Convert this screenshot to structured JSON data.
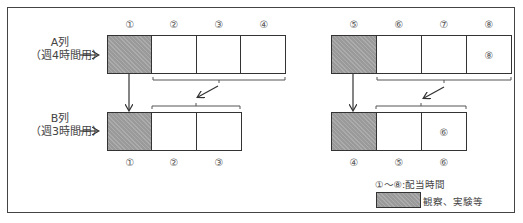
{
  "labels": {
    "a_row_line1": "A列",
    "a_row_line2": "（週4時間用）",
    "b_row_line1": "B列",
    "b_row_line2": "（週3時間用）",
    "arrow": "→"
  },
  "a_left": {
    "top_numbers": [
      "①",
      "②",
      "③",
      "④"
    ],
    "inner": [
      "",
      "",
      "",
      ""
    ]
  },
  "a_right": {
    "top_numbers": [
      "⑤",
      "⑥",
      "⑦",
      "⑧"
    ],
    "inner": [
      "",
      "",
      "",
      "⑧"
    ]
  },
  "b_left": {
    "bottom_numbers": [
      "①",
      "②",
      "③"
    ],
    "inner": [
      "",
      "",
      ""
    ]
  },
  "b_right": {
    "bottom_numbers": [
      "④",
      "⑤",
      "⑥"
    ],
    "inner": [
      "",
      "",
      "⑥"
    ]
  },
  "legend": {
    "numbers_note": "①～⑧:配当時間",
    "hatch_note": "観察、実験等"
  },
  "colors": {
    "hatch": "#9a9a9a",
    "border": "#333333"
  }
}
